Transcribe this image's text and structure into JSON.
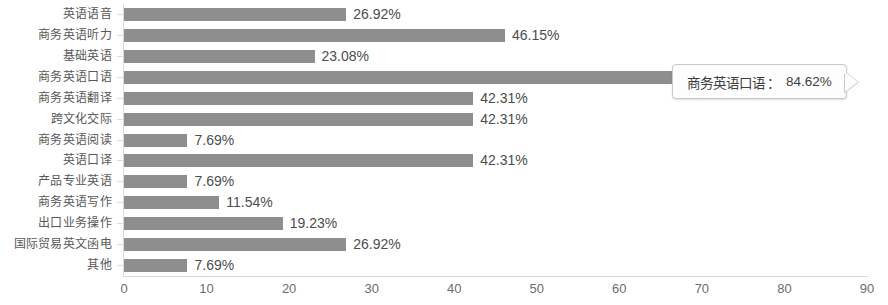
{
  "chart_data": {
    "type": "bar",
    "orientation": "horizontal",
    "title": "",
    "xlabel": "",
    "ylabel": "",
    "xlim": [
      0,
      90
    ],
    "xticks": [
      0,
      10,
      20,
      30,
      40,
      50,
      60,
      70,
      80,
      90
    ],
    "grid": false,
    "legend": null,
    "bar_color": "#8e8e8e",
    "value_suffix": "%",
    "categories": [
      "英语语音",
      "商务英语听力",
      "基础英语",
      "商务英语口语",
      "商务英语翻译",
      "跨文化交际",
      "商务英语阅读",
      "英语口译",
      "产品专业英语",
      "商务英语写作",
      "出口业务操作",
      "国际贸易英文函电",
      "其他"
    ],
    "values": [
      26.92,
      46.15,
      23.08,
      84.62,
      42.31,
      42.31,
      7.69,
      42.31,
      7.69,
      11.54,
      19.23,
      26.92,
      7.69
    ],
    "value_labels": [
      "26.92%",
      "46.15%",
      "23.08%",
      "84.62%",
      "42.31%",
      "42.31%",
      "7.69%",
      "42.31%",
      "7.69%",
      "11.54%",
      "19.23%",
      "26.92%",
      "7.69%"
    ],
    "label_hidden_index": 3,
    "annotations": [
      {
        "type": "tooltip",
        "category": "商务英语口语",
        "separator": "：",
        "value_label": "84.62%",
        "target_index": 3
      }
    ]
  },
  "tooltip": {
    "name": "商务英语口语",
    "separator": "：",
    "value": "84.62%"
  }
}
